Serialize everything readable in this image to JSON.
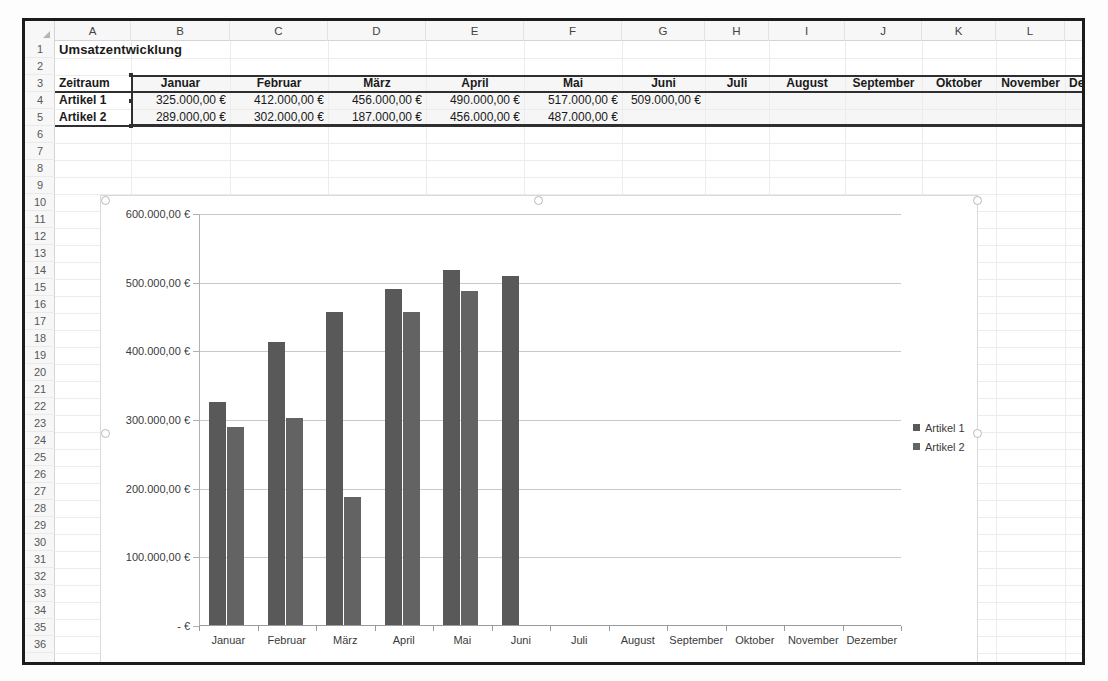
{
  "app": {
    "kind": "spreadsheet-with-chart"
  },
  "sheet": {
    "columns": [
      "A",
      "B",
      "C",
      "D",
      "E",
      "F",
      "G",
      "H",
      "I",
      "J",
      "K",
      "L",
      "M",
      "N"
    ],
    "rows": [
      "1",
      "2",
      "3",
      "4",
      "5",
      "6",
      "7",
      "8",
      "9",
      "10",
      "11",
      "12",
      "13",
      "14",
      "15",
      "16",
      "17",
      "18",
      "19",
      "20",
      "21",
      "22",
      "23",
      "24",
      "25",
      "26",
      "27",
      "28",
      "29",
      "30",
      "31",
      "32",
      "33",
      "34",
      "35",
      "36"
    ],
    "title_cell": "Umsatzentwicklung",
    "table": {
      "corner_label": "Zeitraum",
      "headers": [
        "Januar",
        "Februar",
        "März",
        "April",
        "Mai",
        "Juni",
        "Juli",
        "August",
        "September",
        "Oktober",
        "November",
        "Dezember"
      ],
      "rows": [
        {
          "label": "Artikel 1",
          "values": [
            "325.000,00 €",
            "412.000,00 €",
            "456.000,00 €",
            "490.000,00 €",
            "517.000,00 €",
            "509.000,00 €",
            "",
            "",
            "",
            "",
            "",
            ""
          ]
        },
        {
          "label": "Artikel 2",
          "values": [
            "289.000,00 €",
            "302.000,00 €",
            "187.000,00 €",
            "456.000,00 €",
            "487.000,00 €",
            "",
            "",
            "",
            "",
            "",
            "",
            ""
          ]
        }
      ]
    }
  },
  "chart_data": {
    "type": "bar",
    "title": "",
    "xlabel": "",
    "ylabel": "",
    "categories": [
      "Januar",
      "Februar",
      "März",
      "April",
      "Mai",
      "Juni",
      "Juli",
      "August",
      "September",
      "Oktober",
      "November",
      "Dezember"
    ],
    "series": [
      {
        "name": "Artikel 1",
        "color": "#595959",
        "values": [
          325000,
          412000,
          456000,
          490000,
          517000,
          509000,
          null,
          null,
          null,
          null,
          null,
          null
        ]
      },
      {
        "name": "Artikel 2",
        "color": "#636363",
        "values": [
          289000,
          302000,
          187000,
          456000,
          487000,
          null,
          null,
          null,
          null,
          null,
          null,
          null
        ]
      }
    ],
    "ylim": [
      0,
      600000
    ],
    "ytick_values": [
      0,
      100000,
      200000,
      300000,
      400000,
      500000,
      600000
    ],
    "ytick_labels": [
      "-   €",
      "100.000,00 €",
      "200.000,00 €",
      "300.000,00 €",
      "400.000,00 €",
      "500.000,00 €",
      "600.000,00 €"
    ],
    "grid": "horizontal",
    "legend_position": "right",
    "legend": [
      "Artikel 1",
      "Artikel 2"
    ]
  }
}
